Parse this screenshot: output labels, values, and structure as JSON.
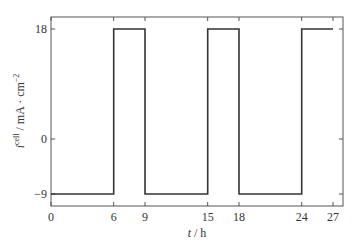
{
  "chart_data": {
    "type": "line",
    "title": "",
    "xlabel": "t / h",
    "ylabel": "i^cell / mA · cm^-2",
    "xlim": [
      0,
      27.9
    ],
    "ylim": [
      -11,
      20
    ],
    "grid": false,
    "legend": null,
    "x_ticks": [
      0,
      6,
      9,
      15,
      18,
      24,
      27
    ],
    "y_ticks": [
      -9,
      0,
      18
    ],
    "series": [
      {
        "name": "i_cell",
        "step": true,
        "x": [
          0,
          6,
          6,
          9,
          9,
          15,
          15,
          18,
          18,
          24,
          24,
          27
        ],
        "y": [
          -9,
          -9,
          18,
          18,
          -9,
          -9,
          18,
          18,
          -9,
          -9,
          18,
          18
        ]
      }
    ],
    "line_color": "#333333"
  },
  "labels": {
    "x_axis_var": "t",
    "x_axis_unit": " / h",
    "y_axis_var": "i",
    "y_axis_sup": "cell",
    "y_axis_unit": " / mA · cm",
    "y_axis_unit_sup": "−2"
  }
}
